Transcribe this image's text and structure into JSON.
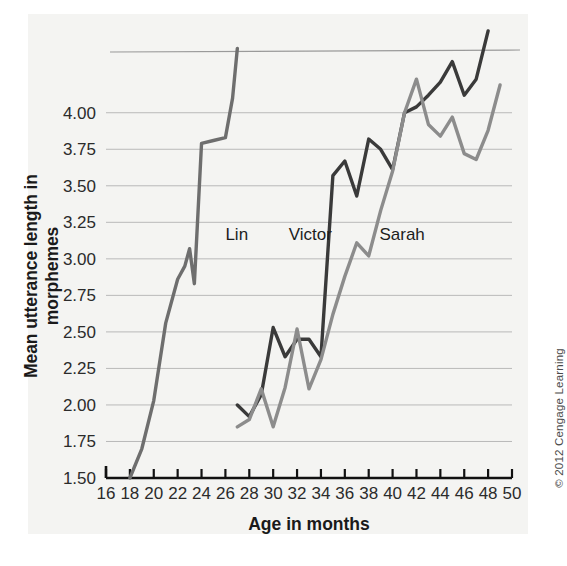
{
  "figure": {
    "copyright": "© 2012 Cengage Learning"
  },
  "chart_data": {
    "type": "line",
    "title": "",
    "xlabel": "Age in months",
    "ylabel": "Mean utterance length in morphemes",
    "xlim": [
      16,
      50
    ],
    "ylim": [
      1.5,
      4.45
    ],
    "xticks": [
      16,
      18,
      20,
      22,
      24,
      26,
      28,
      30,
      32,
      34,
      36,
      38,
      40,
      42,
      44,
      46,
      48,
      50
    ],
    "xticklabels": [
      "16",
      "18",
      "20",
      "22",
      "24",
      "26",
      "28",
      "30",
      "32",
      "34",
      "36",
      "38",
      "40",
      "42",
      "44",
      "46",
      "48",
      "50"
    ],
    "yticks": [
      1.5,
      1.75,
      2.0,
      2.25,
      2.5,
      2.75,
      3.0,
      3.25,
      3.5,
      3.75,
      4.0
    ],
    "yticklabels": [
      "1.50",
      "1.75",
      "2.00",
      "2.25",
      "2.50",
      "2.75",
      "3.00",
      "3.25",
      "3.50",
      "3.75",
      "4.00"
    ],
    "grid": true,
    "grid_axis": "y",
    "legend": "inline-annotations",
    "annotations": [
      {
        "text": "Lin",
        "x": 26.0,
        "y": 3.13
      },
      {
        "text": "Victor",
        "x": 31.3,
        "y": 3.13
      },
      {
        "text": "Sarah",
        "x": 38.9,
        "y": 3.13
      }
    ],
    "series": [
      {
        "name": "Lin",
        "color": "#6e6e6e",
        "x": [
          18,
          19,
          20,
          21,
          22,
          22.6,
          23,
          23.4,
          24,
          25,
          26,
          26.6,
          27
        ],
        "y": [
          1.5,
          1.7,
          2.03,
          2.56,
          2.86,
          2.95,
          3.07,
          2.83,
          3.79,
          3.81,
          3.83,
          4.1,
          4.44
        ]
      },
      {
        "name": "Victor",
        "color": "#3a3a3a",
        "x": [
          27,
          28,
          29,
          30,
          31,
          32,
          33,
          34,
          35,
          36,
          37,
          38,
          39,
          40,
          41,
          42,
          43,
          44,
          45,
          46,
          47,
          48
        ],
        "y": [
          2.0,
          1.92,
          2.07,
          2.53,
          2.33,
          2.45,
          2.45,
          2.33,
          3.57,
          3.67,
          3.43,
          3.82,
          3.75,
          3.61,
          4.0,
          4.04,
          4.12,
          4.21,
          4.35,
          4.12,
          4.23,
          4.56
        ]
      },
      {
        "name": "Sarah",
        "color": "#8c8c8c",
        "x": [
          27,
          28,
          29,
          30,
          31,
          32,
          33,
          34,
          35,
          36,
          37,
          38,
          39,
          40,
          41,
          42,
          43,
          44,
          45,
          46,
          47,
          48,
          49
        ],
        "y": [
          1.85,
          1.9,
          2.11,
          1.85,
          2.12,
          2.52,
          2.11,
          2.31,
          2.62,
          2.88,
          3.11,
          3.02,
          3.33,
          3.6,
          4.0,
          4.23,
          3.92,
          3.84,
          3.97,
          3.72,
          3.68,
          3.88,
          4.19
        ]
      }
    ]
  }
}
